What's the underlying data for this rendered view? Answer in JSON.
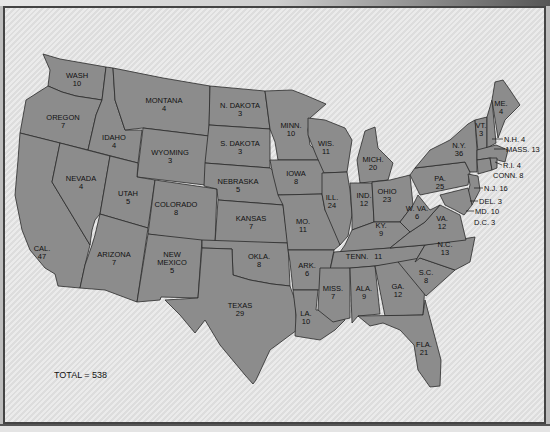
{
  "map": {
    "total_label": "TOTAL = 538",
    "fill_color": "#8c8c8c",
    "background_color": "#e4e4e4",
    "border_color": "#2a2a2a",
    "states": [
      {
        "abbr": "WASH",
        "votes": "10"
      },
      {
        "abbr": "OREGON",
        "votes": "7"
      },
      {
        "abbr": "CAL.",
        "votes": "47"
      },
      {
        "abbr": "IDAHO",
        "votes": "4"
      },
      {
        "abbr": "NEVADA",
        "votes": "4"
      },
      {
        "abbr": "MONTANA",
        "votes": "4"
      },
      {
        "abbr": "WYOMING",
        "votes": "3"
      },
      {
        "abbr": "UTAH",
        "votes": "5"
      },
      {
        "abbr": "ARIZONA",
        "votes": "7"
      },
      {
        "abbr": "COLORADO",
        "votes": "8"
      },
      {
        "abbr": "NEW",
        "abbr2": "MEXICO",
        "votes": "5"
      },
      {
        "abbr": "N. DAKOTA",
        "votes": "3"
      },
      {
        "abbr": "S. DAKOTA",
        "votes": "3"
      },
      {
        "abbr": "NEBRASKA",
        "votes": "5"
      },
      {
        "abbr": "KANSAS",
        "votes": "7"
      },
      {
        "abbr": "OKLA.",
        "votes": "8"
      },
      {
        "abbr": "TEXAS",
        "votes": "29"
      },
      {
        "abbr": "MINN.",
        "votes": "10"
      },
      {
        "abbr": "IOWA",
        "votes": "8"
      },
      {
        "abbr": "MO.",
        "votes": "11"
      },
      {
        "abbr": "ARK.",
        "votes": "6"
      },
      {
        "abbr": "LA.",
        "votes": "10"
      },
      {
        "abbr": "WIS.",
        "votes": "11"
      },
      {
        "abbr": "ILL.",
        "votes": "24"
      },
      {
        "abbr": "MICH.",
        "votes": "20"
      },
      {
        "abbr": "IND.",
        "votes": "12"
      },
      {
        "abbr": "OHIO",
        "votes": "23"
      },
      {
        "abbr": "KY.",
        "votes": "9"
      },
      {
        "abbr": "TENN.",
        "votes": "11"
      },
      {
        "abbr": "MISS.",
        "votes": "7"
      },
      {
        "abbr": "ALA.",
        "votes": "9"
      },
      {
        "abbr": "GA.",
        "votes": "12"
      },
      {
        "abbr": "FLA.",
        "votes": "21"
      },
      {
        "abbr": "S.C.",
        "votes": "8"
      },
      {
        "abbr": "N.C.",
        "votes": "13"
      },
      {
        "abbr": "VA.",
        "votes": "12"
      },
      {
        "abbr": "W. VA.",
        "votes": "6"
      },
      {
        "abbr": "PA.",
        "votes": "25"
      },
      {
        "abbr": "N.Y.",
        "votes": "36"
      },
      {
        "abbr": "VT.",
        "votes": "3"
      },
      {
        "abbr": "ME.",
        "votes": "4"
      }
    ],
    "callouts": [
      {
        "label": "N.H. 4"
      },
      {
        "label": "MASS. 13"
      },
      {
        "label": "R.I. 4"
      },
      {
        "label": "CONN. 8"
      },
      {
        "label": "N.J. 16"
      },
      {
        "label": "DEL. 3"
      },
      {
        "label": "MD. 10"
      },
      {
        "label": "D.C. 3"
      }
    ]
  }
}
